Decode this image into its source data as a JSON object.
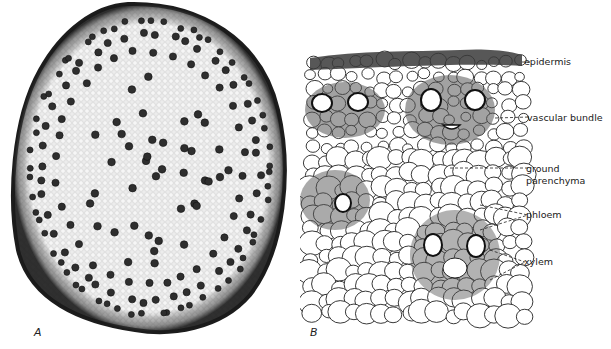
{
  "figure": {
    "panels": [
      {
        "id": "A",
        "label": "A",
        "description": "Low-magnification cross section of monocot stem showing scattered vascular bundles"
      },
      {
        "id": "B",
        "label": "B",
        "description": "Detailed drawing of stem section showing tissues"
      }
    ],
    "annotations": [
      {
        "text": "epidermis"
      },
      {
        "text": "vascular bundle"
      },
      {
        "text": "ground"
      },
      {
        "text": "parenchyma"
      },
      {
        "text": "phloem"
      },
      {
        "text": "xylem"
      }
    ],
    "colors": {
      "background": "#ffffff",
      "tissue_fill": "#e6e6e6",
      "rind": "#2a2a2a",
      "bundle": "#333333",
      "line": "#222222"
    }
  }
}
